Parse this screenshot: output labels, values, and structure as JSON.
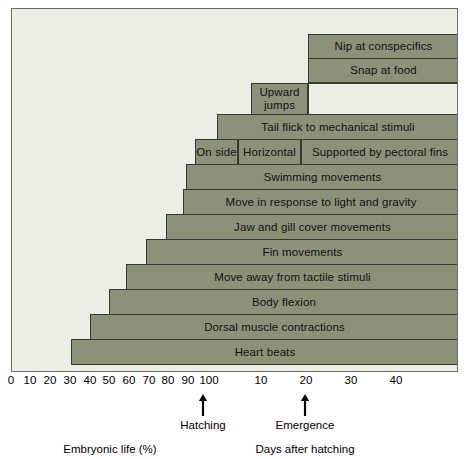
{
  "chart_data": {
    "type": "bar",
    "title": "",
    "subtitle": "",
    "orientation": "horizontal",
    "xlabel_left": "Embryonic life (%)",
    "xlabel_right": "Days after hatching",
    "grid": false,
    "legend": "none",
    "axes": [
      {
        "name": "embryonic-life",
        "label": "Embryonic life (%)",
        "unit": "%",
        "ticks": [
          0,
          10,
          20,
          30,
          40,
          50,
          60,
          70,
          80,
          90,
          100
        ],
        "range": [
          0,
          100
        ],
        "pixel_start": 11,
        "pixel_end": 208
      },
      {
        "name": "days-after-hatching",
        "label": "Days after hatching",
        "unit": "days",
        "ticks": [
          10,
          20,
          30,
          40
        ],
        "range": [
          0,
          50
        ],
        "pixel_start": 208,
        "pixel_end": 458
      }
    ],
    "annotations": [
      {
        "label": "Hatching",
        "axis": "embryonic-life",
        "value": 100,
        "x_px": 203
      },
      {
        "label": "Emergence",
        "axis": "days-after-hatching",
        "value": 21,
        "x_px": 305
      }
    ],
    "rows": [
      {
        "row": 1,
        "y_px": 33,
        "h_px": 25,
        "segments": [
          {
            "label": "Nip at conspecifics",
            "start_px": 307,
            "end_px": 458,
            "start_axis": "days-after-hatching",
            "start_value": 22,
            "filled": true
          }
        ]
      },
      {
        "row": 2,
        "y_px": 57,
        "h_px": 25,
        "segments": [
          {
            "label": "Snap at food",
            "start_px": 307,
            "end_px": 458,
            "start_axis": "days-after-hatching",
            "start_value": 22,
            "filled": true
          }
        ]
      },
      {
        "row": 3,
        "y_px": 82,
        "h_px": 32,
        "segments": [
          {
            "label": "Upward jumps",
            "start_px": 250,
            "end_px": 307,
            "start_axis": "days-after-hatching",
            "start_value": 9,
            "filled": true
          },
          {
            "label": "",
            "start_px": 307,
            "end_px": 458,
            "filled": false
          }
        ]
      },
      {
        "row": 4,
        "y_px": 113,
        "h_px": 26,
        "segments": [
          {
            "label": "Tail flick to mechanical stimuli",
            "start_px": 216,
            "end_px": 458,
            "start_axis": "days-after-hatching",
            "start_value": 2,
            "filled": true
          }
        ]
      },
      {
        "row": 5,
        "y_px": 138,
        "h_px": 26,
        "segments": [
          {
            "label": "On side",
            "start_px": 194,
            "end_px": 237,
            "start_axis": "embryonic-life",
            "start_value": 93,
            "filled": true
          },
          {
            "label": "Horizontal",
            "start_px": 237,
            "end_px": 300,
            "start_axis": "days-after-hatching",
            "start_value": 6,
            "filled": true
          },
          {
            "label": "Supported by pectoral fins",
            "start_px": 300,
            "end_px": 458,
            "start_axis": "days-after-hatching",
            "start_value": 20,
            "filled": true
          }
        ]
      },
      {
        "row": 6,
        "y_px": 163,
        "h_px": 26,
        "segments": [
          {
            "label": "Swimming movements",
            "start_px": 185,
            "end_px": 458,
            "start_axis": "embryonic-life",
            "start_value": 88,
            "filled": true
          }
        ]
      },
      {
        "row": 7,
        "y_px": 188,
        "h_px": 26,
        "segments": [
          {
            "label": "Move in response to light and gravity",
            "start_px": 182,
            "end_px": 458,
            "start_axis": "embryonic-life",
            "start_value": 87,
            "filled": true
          }
        ]
      },
      {
        "row": 8,
        "y_px": 213,
        "h_px": 26,
        "segments": [
          {
            "label": "Jaw and gill cover movements",
            "start_px": 165,
            "end_px": 458,
            "start_axis": "embryonic-life",
            "start_value": 78,
            "filled": true
          }
        ]
      },
      {
        "row": 9,
        "y_px": 238,
        "h_px": 26,
        "segments": [
          {
            "label": "Fin movements",
            "start_px": 145,
            "end_px": 458,
            "start_axis": "embryonic-life",
            "start_value": 68,
            "filled": true
          }
        ]
      },
      {
        "row": 10,
        "y_px": 263,
        "h_px": 26,
        "segments": [
          {
            "label": "Move away from tactile stimuli",
            "start_px": 125,
            "end_px": 458,
            "start_axis": "embryonic-life",
            "start_value": 58,
            "filled": true
          }
        ]
      },
      {
        "row": 11,
        "y_px": 288,
        "h_px": 26,
        "segments": [
          {
            "label": "Body flexion",
            "start_px": 108,
            "end_px": 458,
            "start_axis": "embryonic-life",
            "start_value": 49,
            "filled": true
          }
        ]
      },
      {
        "row": 12,
        "y_px": 313,
        "h_px": 26,
        "segments": [
          {
            "label": "Dorsal muscle contractions",
            "start_px": 89,
            "end_px": 458,
            "start_axis": "embryonic-life",
            "start_value": 40,
            "filled": true
          }
        ]
      },
      {
        "row": 13,
        "y_px": 338,
        "h_px": 26,
        "segments": [
          {
            "label": "Heart beats",
            "start_px": 70,
            "end_px": 458,
            "start_axis": "embryonic-life",
            "start_value": 30,
            "filled": true
          }
        ]
      }
    ],
    "tick_labels": [
      {
        "text": "0",
        "x_px": 11
      },
      {
        "text": "10",
        "x_px": 30
      },
      {
        "text": "20",
        "x_px": 50
      },
      {
        "text": "30",
        "x_px": 70
      },
      {
        "text": "40",
        "x_px": 90
      },
      {
        "text": "50",
        "x_px": 109
      },
      {
        "text": "60",
        "x_px": 129
      },
      {
        "text": "70",
        "x_px": 149
      },
      {
        "text": "80",
        "x_px": 168
      },
      {
        "text": "90",
        "x_px": 188
      },
      {
        "text": "100",
        "x_px": 209
      },
      {
        "text": "10",
        "x_px": 261
      },
      {
        "text": "20",
        "x_px": 306
      },
      {
        "text": "30",
        "x_px": 351
      },
      {
        "text": "40",
        "x_px": 396
      }
    ],
    "colors": {
      "bar_fill": "#8a9279",
      "bar_stroke": "#343a30",
      "plot_background": "#eceee6",
      "frame": "#6b6f68",
      "text": "#000000"
    }
  },
  "captions": {
    "embryonic": "Embryonic life (%)",
    "days": "Days after hatching",
    "hatching": "Hatching",
    "emergence": "Emergence"
  }
}
